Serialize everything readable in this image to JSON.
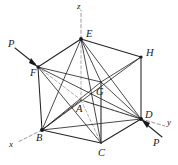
{
  "figure": {
    "type": "3d-geometry-diagram",
    "background_color": "#ffffff",
    "line_color": "#242424",
    "hidden_line_color": "#9a9a9a",
    "axis_color": "#8d8d8d"
  },
  "vertices": [
    {
      "id": "E",
      "label": "E",
      "x": 81,
      "y": 39,
      "label_x": 86,
      "label_y": 29,
      "visible_dot": true
    },
    {
      "id": "F",
      "label": "F",
      "x": 38,
      "y": 67,
      "label_x": 30,
      "label_y": 68,
      "visible_dot": true
    },
    {
      "id": "H",
      "label": "H",
      "x": 141,
      "y": 57,
      "label_x": 146,
      "label_y": 48,
      "visible_dot": true
    },
    {
      "id": "G",
      "label": "G",
      "x": 101,
      "y": 82,
      "label_x": 96,
      "label_y": 87,
      "visible_dot": false
    },
    {
      "id": "A",
      "label": "A",
      "x": 81,
      "y": 100,
      "label_x": 76,
      "label_y": 104,
      "visible_dot": false
    },
    {
      "id": "D",
      "label": "D",
      "x": 141,
      "y": 119,
      "label_x": 145,
      "label_y": 110,
      "visible_dot": true
    },
    {
      "id": "B",
      "label": "B",
      "x": 42,
      "y": 130,
      "label_x": 36,
      "label_y": 133,
      "visible_dot": true
    },
    {
      "id": "C",
      "label": "C",
      "x": 101,
      "y": 143,
      "label_x": 98,
      "label_y": 148,
      "visible_dot": false
    }
  ],
  "axes": [
    {
      "id": "z",
      "label": "z",
      "label_x": 77,
      "label_y": 2,
      "from_x": 81,
      "from_y": 39,
      "to_x": 81,
      "to_y": 10
    },
    {
      "id": "y",
      "label": "y",
      "label_x": 167,
      "label_y": 118,
      "from_x": 141,
      "from_y": 119,
      "to_x": 165,
      "to_y": 126
    },
    {
      "id": "x",
      "label": "x",
      "label_x": 9,
      "label_y": 140,
      "from_x": 42,
      "from_y": 130,
      "to_x": 18,
      "to_y": 142
    }
  ],
  "forces": [
    {
      "id": "P-left",
      "label": "P",
      "label_x": 8,
      "label_y": 39,
      "tail_x": 15,
      "tail_y": 48,
      "head_x": 37,
      "head_y": 66
    },
    {
      "id": "P-right",
      "label": "P",
      "label_x": 153,
      "label_y": 138,
      "tail_x": 162,
      "tail_y": 137,
      "head_x": 142,
      "head_y": 121
    }
  ],
  "edges_solid": [
    [
      "E",
      "F"
    ],
    [
      "E",
      "H"
    ],
    [
      "E",
      "B"
    ],
    [
      "E",
      "D"
    ],
    [
      "E",
      "A"
    ],
    [
      "E",
      "G"
    ],
    [
      "F",
      "B"
    ],
    [
      "H",
      "D"
    ],
    [
      "B",
      "C"
    ],
    [
      "C",
      "D"
    ],
    [
      "B",
      "D"
    ],
    [
      "B",
      "G"
    ],
    [
      "B",
      "H"
    ],
    [
      "D",
      "F"
    ],
    [
      "D",
      "G"
    ],
    [
      "D",
      "A"
    ],
    [
      "G",
      "C"
    ],
    [
      "A",
      "B"
    ],
    [
      "F",
      "G"
    ],
    [
      "G",
      "H"
    ]
  ],
  "edges_hidden": [
    [
      "F",
      "A"
    ],
    [
      "A",
      "C"
    ],
    [
      "A",
      "D"
    ]
  ]
}
